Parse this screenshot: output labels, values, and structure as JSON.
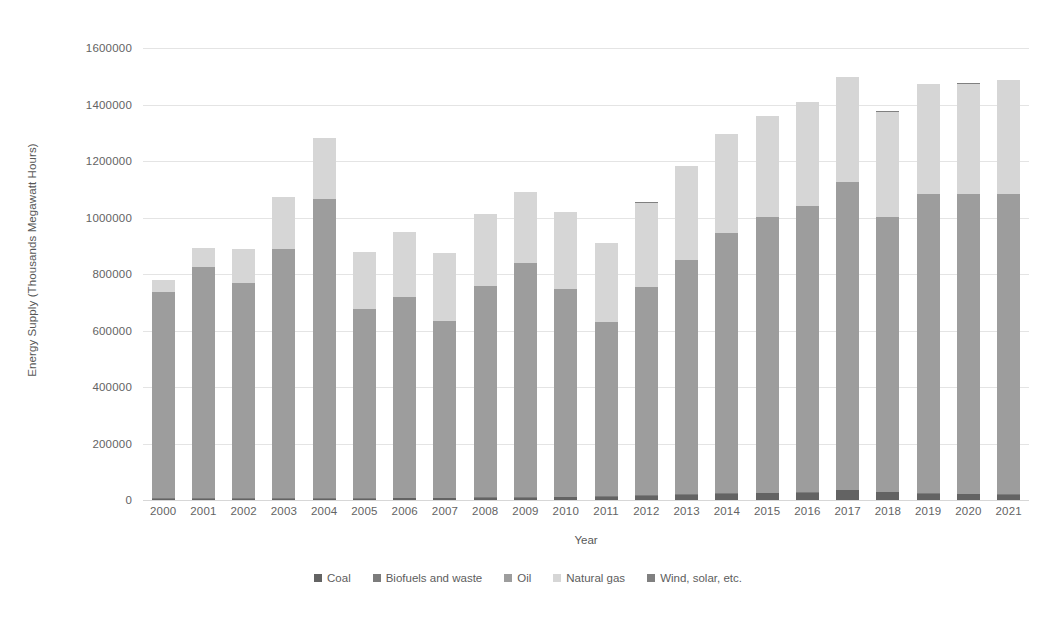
{
  "chart_data": {
    "type": "bar",
    "stacked": true,
    "title": "",
    "xlabel": "Year",
    "ylabel": "Energy Supply (Thousands Megawatt Hours)",
    "ylim": [
      0,
      1600000
    ],
    "ytick_step": 200000,
    "ytick_labels": [
      "1600000",
      "1400000",
      "1200000",
      "1000000",
      "800000",
      "600000",
      "400000",
      "200000",
      "0"
    ],
    "ytick_values": [
      1600000,
      1400000,
      1200000,
      1000000,
      800000,
      600000,
      400000,
      200000,
      0
    ],
    "grid": true,
    "legend_position": "bottom",
    "categories": [
      "2000",
      "2001",
      "2002",
      "2003",
      "2004",
      "2005",
      "2006",
      "2007",
      "2008",
      "2009",
      "2010",
      "2011",
      "2012",
      "2013",
      "2014",
      "2015",
      "2016",
      "2017",
      "2018",
      "2019",
      "2020",
      "2021"
    ],
    "series": [
      {
        "name": "Coal",
        "color": "#636363",
        "values": [
          4000,
          4000,
          4000,
          5000,
          5000,
          5000,
          6000,
          6000,
          7000,
          8000,
          9000,
          11000,
          14000,
          18000,
          22000,
          24000,
          26000,
          34000,
          27000,
          22000,
          20000,
          19000
        ]
      },
      {
        "name": "Biofuels and waste",
        "color": "#7c7c7c",
        "values": [
          2000,
          2000,
          2000,
          2000,
          2000,
          2000,
          2000,
          2000,
          2000,
          2000,
          2000,
          2000,
          2000,
          2000,
          2000,
          2000,
          2000,
          2000,
          2000,
          2000,
          2000,
          2000
        ]
      },
      {
        "name": "Oil",
        "color": "#9d9d9d",
        "values": [
          730000,
          818000,
          762000,
          883000,
          1060000,
          668000,
          712000,
          627000,
          750000,
          830000,
          737000,
          617000,
          737000,
          829000,
          923000,
          977000,
          1012000,
          1091000,
          972000,
          1061000,
          1062000,
          1063000
        ]
      },
      {
        "name": "Natural gas",
        "color": "#d6d6d6",
        "values": [
          43000,
          68000,
          120000,
          182000,
          215000,
          202000,
          228000,
          240000,
          253000,
          249000,
          272000,
          280000,
          300000,
          334000,
          348000,
          357000,
          368000,
          370000,
          374000,
          388000,
          390000,
          403000
        ]
      },
      {
        "name": "Wind, solar, etc.",
        "color": "#808080",
        "values": [
          1000,
          1000,
          1000,
          1000,
          1000,
          1000,
          1000,
          1000,
          1000,
          1000,
          1000,
          1000,
          1000,
          1000,
          1000,
          1000,
          1000,
          1000,
          1000,
          1000,
          1000,
          1000
        ]
      }
    ],
    "totals": [
      780000,
      893000,
      889000,
      1073000,
      1283000,
      878000,
      949000,
      876000,
      1013000,
      1090000,
      1021000,
      911000,
      1054000,
      1184000,
      1296000,
      1361000,
      1409000,
      1498000,
      1376000,
      1474000,
      1475000,
      1488000
    ]
  },
  "legend": {
    "items": [
      {
        "label": "Coal",
        "color": "#636363"
      },
      {
        "label": "Biofuels and waste",
        "color": "#7c7c7c"
      },
      {
        "label": "Oil",
        "color": "#9d9d9d"
      },
      {
        "label": "Natural gas",
        "color": "#d6d6d6"
      },
      {
        "label": "Wind, solar, etc.",
        "color": "#808080"
      }
    ]
  }
}
